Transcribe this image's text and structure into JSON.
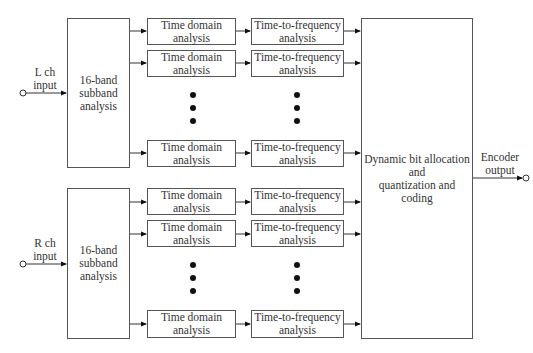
{
  "diagram": {
    "type": "block-diagram",
    "channels": [
      {
        "input_label": "L ch\ninput",
        "subband_label": "16-band\nsubband\nanalysis",
        "rows": [
          {
            "time_domain": "Time domain\nanalysis",
            "time_to_freq": "Time-to-frequency\nanalysis"
          },
          {
            "time_domain": "Time domain\nanalysis",
            "time_to_freq": "Time-to-frequency\nanalysis"
          },
          {
            "time_domain": "Time domain\nanalysis",
            "time_to_freq": "Time-to-frequency\nanalysis"
          }
        ]
      },
      {
        "input_label": "R ch\ninput",
        "subband_label": "16-band\nsubband\nanalysis",
        "rows": [
          {
            "time_domain": "Time domain\nanalysis",
            "time_to_freq": "Time-to-frequency\nanalysis"
          },
          {
            "time_domain": "Time domain\nanalysis",
            "time_to_freq": "Time-to-frequency\nanalysis"
          },
          {
            "time_domain": "Time domain\nanalysis",
            "time_to_freq": "Time-to-frequency\nanalysis"
          }
        ]
      }
    ],
    "central_block": "Dynamic bit allocation\nand\nquantization and coding",
    "output_label": "Encoder\noutput"
  }
}
